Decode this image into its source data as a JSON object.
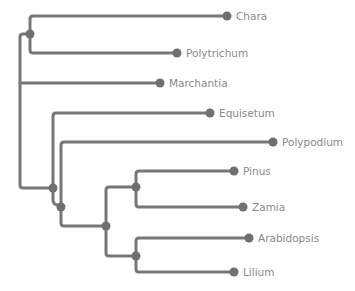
{
  "diagram": {
    "type": "phylogenetic-tree",
    "colors": {
      "branch": "#777777",
      "node": "#707070",
      "label": "#8a8a8a",
      "background": "#ffffff"
    },
    "taxa": [
      {
        "name": "Chara",
        "tip_x": 227,
        "y": 16
      },
      {
        "name": "Polytrichum",
        "tip_x": 177,
        "y": 53
      },
      {
        "name": "Marchantia",
        "tip_x": 160,
        "y": 83
      },
      {
        "name": "Equisetum",
        "tip_x": 210,
        "y": 113
      },
      {
        "name": "Polypodium",
        "tip_x": 273,
        "y": 142
      },
      {
        "name": "Pinus",
        "tip_x": 234,
        "y": 171
      },
      {
        "name": "Zamia",
        "tip_x": 243,
        "y": 207
      },
      {
        "name": "Arabidopsis",
        "tip_x": 249,
        "y": 238
      },
      {
        "name": "Lilium",
        "tip_x": 234,
        "y": 272
      }
    ],
    "internal_nodes": [
      {
        "id": "chara-polytrichum",
        "x": 30,
        "y": 34
      },
      {
        "id": "vascular-plants",
        "x": 53,
        "y": 188
      },
      {
        "id": "euphyllophytes",
        "x": 61,
        "y": 207
      },
      {
        "id": "seed-plants",
        "x": 106,
        "y": 226
      },
      {
        "id": "gymnosperms",
        "x": 136,
        "y": 187
      },
      {
        "id": "angiosperms",
        "x": 136,
        "y": 256
      }
    ]
  }
}
